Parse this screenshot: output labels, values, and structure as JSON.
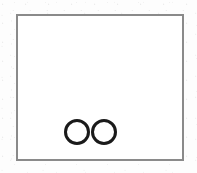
{
  "page": {
    "width_px": 197,
    "height_px": 173,
    "background_color": "#fdfdfd",
    "media": "scanned-paper-fragment"
  },
  "figure": {
    "frame": {
      "name": "rectangular-border",
      "shape": "rectangle",
      "stroke_color": "#8a8a8a",
      "stroke_width_px": 2,
      "fill_color": "#ffffff",
      "left_px": 16,
      "top_px": 14,
      "width_px": 168,
      "height_px": 147
    },
    "glyph": {
      "name": "double-ring-mark",
      "description": "two adjoining open circles forming an infinity / OO mark",
      "text_equivalent": "∞",
      "stroke_color": "#1a1a1a",
      "stroke_width_px": 3,
      "fill": "none",
      "left_px": 63,
      "top_px": 117,
      "width_px": 56,
      "height_px": 30,
      "circles": [
        {
          "label": "left-ring",
          "cx_px": 14,
          "cy_px": 15,
          "r_px": 11.5
        },
        {
          "label": "right-ring",
          "cx_px": 41,
          "cy_px": 15,
          "r_px": 11.5
        }
      ]
    }
  }
}
